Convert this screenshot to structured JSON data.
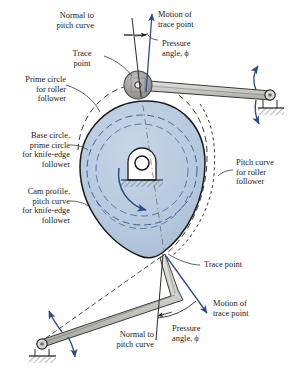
{
  "figure": {
    "type": "engineering-diagram",
    "colors": {
      "cam_fill": "#b8cadf",
      "cam_outline": "#1a1a1a",
      "link_fill": "#c9c9c4",
      "roller_fill": "#9e9e9e",
      "annotation_blue": "#2b4d8c",
      "dash_gray": "#4a4a4a",
      "text": "#1a1a1a",
      "background": "#ffffff"
    }
  },
  "labels": {
    "normal_to_pitch_curve_top": "Normal to\npitch curve",
    "motion_of_trace_point_top": "Motion of\ntrace point",
    "pressure_angle_top": "Pressure\nangle, ϕ",
    "trace_point_top": "Trace\npoint",
    "prime_circle_for_roller_follower": "Prime circle\nfor roller\nfollower",
    "base_circle_prime_circle_knife_edge": "Base circle,\nprime circle\nfor knife-edge\nfollower",
    "cam_profile_pitch_curve_knife_edge": "Cam profile,\npitch curve\nfor knife-edge\nfollower",
    "pitch_curve_for_roller_follower": "Pitch curve\nfor roller\nfollower",
    "trace_point_bottom": "Trace point",
    "motion_of_trace_point_bottom": "Motion of\ntrace point",
    "pressure_angle_bottom": "Pressure\nangle, ϕ",
    "normal_to_pitch_curve_bottom": "Normal to\npitch curve"
  },
  "parts": {
    "cam": "cam-body",
    "cam_hub": "cam-hub-bearing",
    "rotation_arrow": "cam-rotation-arrow",
    "roller": "roller-follower-roller",
    "upper_arm": "oscillating-roller-follower-arm",
    "upper_pivot": "upper-follower-ground-pivot",
    "lower_arm": "oscillating-knife-edge-follower-arm",
    "lower_pivot": "lower-follower-ground-pivot",
    "prime_circle": "prime-circle-dashed-arc",
    "pitch_curve": "pitch-curve-dashed-arc",
    "base_circle": "base-circle-dashed-arc"
  }
}
